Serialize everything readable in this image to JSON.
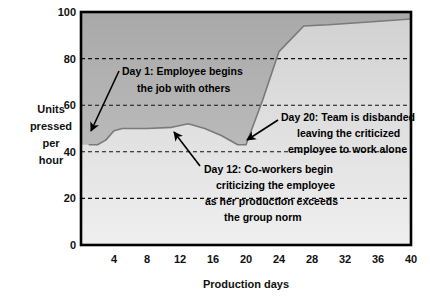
{
  "chart_data": {
    "type": "line",
    "title": "",
    "xlabel": "Production days",
    "ylabel": "Units pressed per hour",
    "ylabel_lines": [
      "Units",
      "pressed",
      "per",
      "hour"
    ],
    "xlim": [
      0,
      40
    ],
    "ylim": [
      0,
      100
    ],
    "xticks": [
      4,
      8,
      12,
      16,
      20,
      24,
      28,
      32,
      36,
      40
    ],
    "xtick_labels": [
      "4",
      "8",
      "12",
      "16",
      "20",
      "24",
      "28",
      "32",
      "36",
      "40"
    ],
    "yticks": [
      0,
      20,
      40,
      60,
      80,
      100
    ],
    "ytick_labels": [
      "0",
      "20",
      "40",
      "60",
      "80",
      "100"
    ],
    "grid": "horizontal-dashed",
    "legend": "none",
    "series": [
      {
        "name": "Units pressed per hour",
        "x": [
          1,
          2,
          3,
          4,
          5,
          8,
          11,
          13,
          15,
          17,
          19,
          20,
          22,
          24,
          27,
          30,
          34,
          40
        ],
        "values": [
          43,
          43,
          45,
          49,
          50,
          50,
          50.5,
          52,
          50,
          47,
          43,
          43,
          62,
          83,
          94,
          94.5,
          95.5,
          97
        ]
      }
    ],
    "annotations": [
      {
        "id": "day-1",
        "lines": [
          "Day 1: Employee begins",
          "the job with others"
        ],
        "point_day": 1,
        "point_value": 45
      },
      {
        "id": "day-12",
        "lines": [
          "Day 12: Co-workers begin",
          "criticizing the employee",
          "as her production exceeds",
          "the group norm"
        ],
        "point_day": 11,
        "point_value": 50
      },
      {
        "id": "day-20",
        "lines": [
          "Day 20: Team is disbanded",
          "leaving the criticized",
          "employee to work alone"
        ],
        "point_day": 20,
        "point_value": 45
      }
    ],
    "colors": {
      "line": "#7a7a7a",
      "fill_above": "#b4b4b4",
      "fill_below": "#dcdcdc",
      "axis": "#000000",
      "grid": "#000000",
      "background": "#ffffff"
    }
  }
}
